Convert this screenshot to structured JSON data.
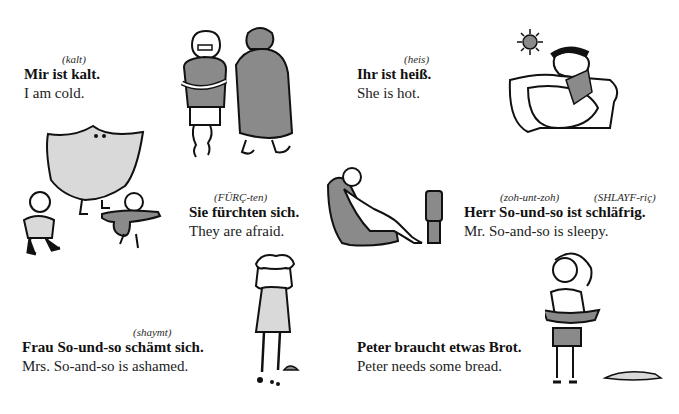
{
  "page": {
    "phrases": [
      {
        "pron": [
          "(kalt)"
        ],
        "german": "Mir ist kalt.",
        "english": "I am cold."
      },
      {
        "pron": [
          "(heis)"
        ],
        "german": "Ihr ist heiß.",
        "english": "She is hot."
      },
      {
        "pron": [
          "(FÜRÇ-ten)"
        ],
        "german": "Sie fürchten sich.",
        "english": "They are afraid."
      },
      {
        "pron": [
          "(zoh-unt-zoh)",
          "(SHLAYF-riç)"
        ],
        "german": "Herr So-und-so ist schläfrig.",
        "english": "Mr. So-and-so is sleepy."
      },
      {
        "pron": [
          "(shaymt)"
        ],
        "german": "Frau So-und-so schämt sich.",
        "english": "Mrs. So-and-so is ashamed."
      },
      {
        "pron": [],
        "german": "Peter braucht etwas Brot.",
        "english": "Peter needs some bread."
      }
    ],
    "illustrations": [
      {
        "name": "cold-people-illustration",
        "depicts": "man with crossed arms and person in coat"
      },
      {
        "name": "hot-woman-illustration",
        "depicts": "woman in armchair with fan under sun"
      },
      {
        "name": "ghost-children-illustration",
        "depicts": "ghost chasing two children"
      },
      {
        "name": "sleepy-man-illustration",
        "depicts": "man slouched in armchair before TV"
      },
      {
        "name": "ashamed-woman-illustration",
        "depicts": "woman holding head over broken pot"
      },
      {
        "name": "peter-bread-illustration",
        "depicts": "boy holding empty tray, loaf of bread"
      }
    ],
    "colors": {
      "text": "#151515",
      "shade": "#8a8a8a",
      "light_shade": "#d9d9d9",
      "ink": "#111111"
    }
  }
}
